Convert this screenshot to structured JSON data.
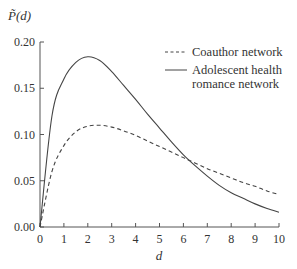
{
  "chart_data": {
    "type": "line",
    "title": "",
    "xlabel": "d",
    "ylabel": "P̃(d)",
    "xlim": [
      0,
      10
    ],
    "ylim": [
      0,
      0.2
    ],
    "xticks": [
      "0",
      "1",
      "2",
      "3",
      "4",
      "5",
      "6",
      "7",
      "8",
      "9",
      "10"
    ],
    "yticks": [
      "0.00",
      "0.05",
      "0.10",
      "0.15",
      "0.20"
    ],
    "grid": false,
    "legend_position": "upper right",
    "x": [
      0,
      0.5,
      1,
      1.5,
      2,
      2.5,
      3,
      3.5,
      4,
      4.5,
      5,
      5.5,
      6,
      6.5,
      7,
      7.5,
      8,
      8.5,
      9,
      9.5,
      10
    ],
    "series": [
      {
        "name": "Coauthor network",
        "style": "dashed",
        "values": [
          0.0,
          0.06,
          0.088,
          0.103,
          0.109,
          0.11,
          0.108,
          0.104,
          0.099,
          0.093,
          0.087,
          0.081,
          0.075,
          0.069,
          0.063,
          0.058,
          0.053,
          0.048,
          0.044,
          0.039,
          0.035
        ]
      },
      {
        "name": "Adolescent health romance network",
        "style": "solid",
        "values": [
          0.0,
          0.12,
          0.16,
          0.178,
          0.184,
          0.18,
          0.168,
          0.153,
          0.138,
          0.122,
          0.107,
          0.092,
          0.078,
          0.066,
          0.055,
          0.045,
          0.037,
          0.031,
          0.025,
          0.02,
          0.016
        ]
      }
    ]
  },
  "legend": {
    "items": [
      {
        "label_lines": [
          "Coauthor network"
        ],
        "style": "dashed"
      },
      {
        "label_lines": [
          "Adolescent health",
          "romance network"
        ],
        "style": "solid"
      }
    ]
  },
  "colors": {
    "line": "#444444",
    "axis": "#555555",
    "text": "#333333"
  }
}
